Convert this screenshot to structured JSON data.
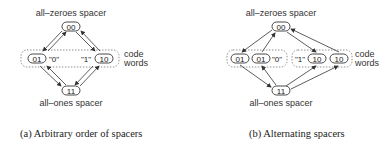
{
  "panels": [
    {
      "id": "a",
      "top_label": "all–zeroes spacer",
      "bottom_label": "all–ones spacer",
      "top_node": "00",
      "bottom_node": "11",
      "left_nodes": [
        "01"
      ],
      "right_nodes": [
        "10"
      ],
      "left_symbol": "\"0\"",
      "right_symbol": "\"1\"",
      "group_label_line1": "code",
      "group_label_line2": "words",
      "caption": "(a) Arbitrary order of spacers"
    },
    {
      "id": "b",
      "top_label": "all–zeroes spacer",
      "bottom_label": "all–ones spacer",
      "top_node": "00",
      "bottom_node": "11",
      "left_nodes": [
        "01",
        "01"
      ],
      "right_nodes": [
        "10",
        "10"
      ],
      "left_symbol": "\"0\"",
      "right_symbol": "\"1\"",
      "group_label_line1": "code",
      "group_label_line2": "words",
      "caption": "(b) Alternating spacers"
    }
  ],
  "colors": {
    "stroke": "#333333",
    "dotted": "#777777"
  }
}
